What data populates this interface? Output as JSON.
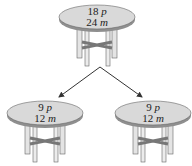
{
  "diagram": {
    "title": "",
    "colors": {
      "tabletop": "#d9d9d9",
      "edge": "#8a8a8a",
      "legs": "#e4e4e4",
      "stroke": "#555555",
      "arrow": "#333333"
    },
    "nodes": [
      {
        "id": "top",
        "line1_num": "18",
        "line1_var": "p",
        "line2_num": "24",
        "line2_var": "m"
      },
      {
        "id": "left",
        "line1_num": "9",
        "line1_var": "p",
        "line2_num": "12",
        "line2_var": "m"
      },
      {
        "id": "right",
        "line1_num": "9",
        "line1_var": "p",
        "line2_num": "12",
        "line2_var": "m"
      }
    ],
    "edges": [
      {
        "from": "top",
        "to": "left"
      },
      {
        "from": "top",
        "to": "right"
      }
    ]
  }
}
